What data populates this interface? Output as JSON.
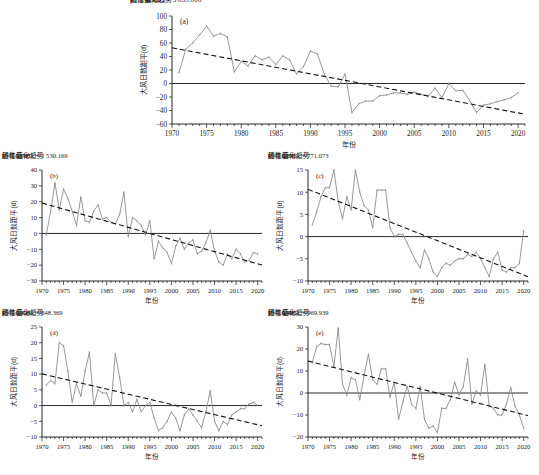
{
  "figure": {
    "background": "#ffffff",
    "series_color": "#8c8c8c",
    "trend_color": "#111111",
    "axis_color": "#111111"
  },
  "legend": {
    "series_label": "历年值",
    "trend_label": "线性变化趋势"
  },
  "axis_titles": {
    "x": "年份",
    "y": "大风日数距平(d)"
  },
  "chart_data": [
    {
      "type": "line",
      "panel": "(a)",
      "title": "",
      "xlabel": "年份",
      "ylabel": "大风日数距平(d)",
      "equation": "y = −1.930x + 3 855.006",
      "r2": "R² = 0.689",
      "slope": -1.93,
      "intercept": 3855.006,
      "xlim": [
        1970,
        2021
      ],
      "ylim": [
        -60,
        100
      ],
      "yticks": [
        -60,
        -40,
        -20,
        0,
        20,
        40,
        60,
        80,
        100
      ],
      "xticks": [
        1970,
        1975,
        1980,
        1985,
        1990,
        1995,
        2000,
        2005,
        2010,
        2015,
        2020
      ],
      "x": [
        1971,
        1972,
        1973,
        1974,
        1975,
        1976,
        1977,
        1978,
        1979,
        1980,
        1981,
        1982,
        1983,
        1984,
        1985,
        1986,
        1987,
        1988,
        1989,
        1990,
        1991,
        1992,
        1993,
        1994,
        1995,
        1996,
        1997,
        1998,
        1999,
        2000,
        2001,
        2002,
        2003,
        2004,
        2005,
        2006,
        2007,
        2008,
        2009,
        2010,
        2011,
        2012,
        2013,
        2014,
        2015,
        2016,
        2017,
        2018,
        2019,
        2020
      ],
      "values": [
        16,
        51,
        60,
        72,
        85,
        70,
        74,
        69,
        17,
        33,
        26,
        41,
        35,
        39,
        28,
        41,
        35,
        14,
        25,
        48,
        44,
        14,
        -4,
        -5,
        14,
        -43,
        -30,
        -26,
        -26,
        -18,
        -17,
        -14,
        -14,
        -16,
        -13,
        -16,
        -19,
        -7,
        -21,
        0,
        -11,
        -10,
        -25,
        -43,
        -32,
        -30,
        -27,
        -24,
        -21,
        -14
      ]
    },
    {
      "type": "line",
      "panel": "(b)",
      "title": "",
      "xlabel": "年份",
      "ylabel": "大风日数距平(d)",
      "equation": "y = −0.767x + 1 530.169",
      "r2": "R² = 0.668",
      "slope": -0.767,
      "intercept": 1530.169,
      "xlim": [
        1970,
        2021
      ],
      "ylim": [
        -30,
        40
      ],
      "yticks": [
        -30,
        -20,
        -10,
        0,
        10,
        20,
        30,
        40
      ],
      "xticks": [
        1970,
        1975,
        1980,
        1985,
        1990,
        1995,
        2000,
        2005,
        2010,
        2015,
        2020
      ],
      "x": [
        1971,
        1972,
        1973,
        1974,
        1975,
        1976,
        1977,
        1978,
        1979,
        1980,
        1981,
        1982,
        1983,
        1984,
        1985,
        1986,
        1987,
        1988,
        1989,
        1990,
        1991,
        1992,
        1993,
        1994,
        1995,
        1996,
        1997,
        1998,
        1999,
        2000,
        2001,
        2002,
        2003,
        2004,
        2005,
        2006,
        2007,
        2008,
        2009,
        2010,
        2011,
        2012,
        2013,
        2014,
        2015,
        2016,
        2017,
        2018,
        2019,
        2020
      ],
      "values": [
        -1,
        14,
        32,
        15,
        28,
        22,
        14,
        5,
        23,
        8,
        7,
        14,
        18,
        9,
        10,
        7,
        6,
        12,
        26,
        -2,
        10,
        8,
        5,
        -1,
        8,
        -16,
        -5,
        -9,
        -12,
        -19,
        -8,
        -3,
        -10,
        -6,
        -4,
        -13,
        -11,
        -6,
        2,
        -11,
        -18,
        -20,
        -13,
        -16,
        -10,
        -13,
        -18,
        -17,
        -12,
        -13
      ]
    },
    {
      "type": "line",
      "panel": "(c)",
      "title": "",
      "xlabel": "年份",
      "ylabel": "大风日数距平(d)",
      "equation": "y = −0.386x + 771.073",
      "r2": "R² = 0.651",
      "slope": -0.386,
      "intercept": 771.073,
      "xlim": [
        1970,
        2021
      ],
      "ylim": [
        -10,
        15
      ],
      "yticks": [
        -10,
        -5,
        0,
        5,
        10,
        15
      ],
      "xticks": [
        1970,
        1975,
        1980,
        1985,
        1990,
        1995,
        2000,
        2005,
        2010,
        2015,
        2020
      ],
      "x": [
        1971,
        1972,
        1973,
        1974,
        1975,
        1976,
        1977,
        1978,
        1979,
        1980,
        1981,
        1982,
        1983,
        1984,
        1985,
        1986,
        1987,
        1988,
        1989,
        1990,
        1991,
        1992,
        1993,
        1994,
        1995,
        1996,
        1997,
        1998,
        1999,
        2000,
        2001,
        2002,
        2003,
        2004,
        2005,
        2006,
        2007,
        2008,
        2009,
        2010,
        2011,
        2012,
        2013,
        2014,
        2015,
        2016,
        2017,
        2018,
        2019,
        2020
      ],
      "values": [
        2.7,
        5.5,
        9,
        11,
        11,
        15,
        8,
        4,
        9,
        6,
        15,
        10,
        7,
        6,
        2,
        10.5,
        10.5,
        10.5,
        2,
        0,
        0.5,
        0.5,
        -1.5,
        -3.5,
        -5.5,
        -7,
        -3,
        -5,
        -8,
        -9,
        -7,
        -6,
        -6.5,
        -5.5,
        -5,
        -5,
        -4,
        -4.5,
        -3.5,
        -5,
        -7,
        -9,
        -5,
        -3.5,
        -7.5,
        -8,
        -7,
        -7,
        -6,
        1.3
      ]
    },
    {
      "type": "line",
      "panel": "(d)",
      "title": "",
      "xlabel": "年份",
      "ylabel": "大风日数距平(d)",
      "equation": "y = −0.324x + 648.369",
      "r2": "R² = 0.428",
      "slope": -0.324,
      "intercept": 648.369,
      "xlim": [
        1970,
        2021
      ],
      "ylim": [
        -10,
        25
      ],
      "yticks": [
        -10,
        -5,
        0,
        5,
        10,
        15,
        20,
        25
      ],
      "xticks": [
        1970,
        1975,
        1980,
        1985,
        1990,
        1995,
        2000,
        2005,
        2010,
        2015,
        2020
      ],
      "x": [
        1971,
        1972,
        1973,
        1974,
        1975,
        1976,
        1977,
        1978,
        1979,
        1980,
        1981,
        1982,
        1983,
        1984,
        1985,
        1986,
        1987,
        1988,
        1989,
        1990,
        1991,
        1992,
        1993,
        1994,
        1995,
        1996,
        1997,
        1998,
        1999,
        2000,
        2001,
        2002,
        2003,
        2004,
        2005,
        2006,
        2007,
        2008,
        2009,
        2010,
        2011,
        2012,
        2013,
        2014,
        2015,
        2016,
        2017,
        2018,
        2019,
        2020
      ],
      "values": [
        6.5,
        8,
        7,
        20,
        19,
        11,
        1,
        7,
        3,
        11,
        17,
        0,
        5,
        4,
        4,
        0,
        16.5,
        9,
        0,
        1,
        -2,
        2,
        -2,
        0,
        1,
        -4,
        -8,
        -7,
        -5,
        -2,
        -4,
        -8,
        -3,
        -1,
        -3,
        -5,
        -7,
        -2,
        4.7,
        -5,
        -8,
        -5,
        -6,
        -3,
        -2,
        -1,
        -1,
        0.5,
        1,
        0
      ]
    },
    {
      "type": "line",
      "panel": "(e)",
      "title": "",
      "xlabel": "年份",
      "ylabel": "大风日数距平(d)",
      "equation": "y = −0.485x + 969.939",
      "r2": "R² = 0.406",
      "slope": -0.485,
      "intercept": 969.939,
      "xlim": [
        1970,
        2021
      ],
      "ylim": [
        -20,
        30
      ],
      "yticks": [
        -20,
        -10,
        0,
        10,
        20,
        30
      ],
      "xticks": [
        1970,
        1975,
        1980,
        1985,
        1990,
        1995,
        2000,
        2005,
        2010,
        2015,
        2020
      ],
      "x": [
        1971,
        1972,
        1973,
        1974,
        1975,
        1976,
        1977,
        1978,
        1979,
        1980,
        1981,
        1982,
        1983,
        1984,
        1985,
        1986,
        1987,
        1988,
        1989,
        1990,
        1991,
        1992,
        1993,
        1994,
        1995,
        1996,
        1997,
        1998,
        1999,
        2000,
        2001,
        2002,
        2003,
        2004,
        2005,
        2006,
        2007,
        2008,
        2009,
        2010,
        2011,
        2012,
        2013,
        2014,
        2015,
        2016,
        2017,
        2018,
        2019,
        2020
      ],
      "values": [
        14,
        21,
        22.5,
        22,
        22,
        12,
        29.5,
        4,
        -1,
        7,
        6,
        -3,
        8,
        17.5,
        6,
        4,
        11,
        11,
        -2,
        5,
        -12,
        -4,
        3,
        -5,
        -7,
        3,
        -12,
        -16,
        -15,
        -18,
        -7,
        -7,
        -3,
        5,
        -1,
        3,
        15.5,
        -5,
        1,
        -1,
        13,
        -6,
        -7,
        -10,
        -10,
        -5,
        2.5,
        -6,
        -10,
        -16
      ]
    }
  ]
}
